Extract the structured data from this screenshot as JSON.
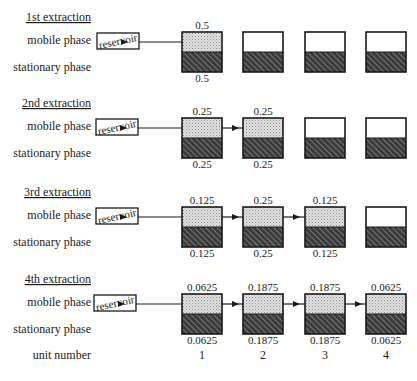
{
  "labels": {
    "mobile_phase": "mobile phase",
    "stationary_phase": "stationary phase",
    "unit_number": "unit number",
    "reservoir": "reservoir"
  },
  "colors": {
    "stroke": "#1a1a1a",
    "mobile_filled": "#d9d9d9",
    "mobile_empty": "#ffffff",
    "stationary_bg": "#3a3a3a",
    "hatch_line": "#9a9a9a"
  },
  "unit_numbers": [
    "1",
    "2",
    "3",
    "4"
  ],
  "extractions": [
    {
      "title": "1st extraction",
      "units": [
        {
          "mobile": "0.5",
          "stationary": "0.5",
          "filled": true
        },
        {
          "mobile": "",
          "stationary": "",
          "filled": false
        },
        {
          "mobile": "",
          "stationary": "",
          "filled": false
        },
        {
          "mobile": "",
          "stationary": "",
          "filled": false
        }
      ]
    },
    {
      "title": "2nd extraction",
      "units": [
        {
          "mobile": "0.25",
          "stationary": "0.25",
          "filled": true
        },
        {
          "mobile": "0.25",
          "stationary": "0.25",
          "filled": true
        },
        {
          "mobile": "",
          "stationary": "",
          "filled": false
        },
        {
          "mobile": "",
          "stationary": "",
          "filled": false
        }
      ]
    },
    {
      "title": "3rd extraction",
      "units": [
        {
          "mobile": "0.125",
          "stationary": "0.125",
          "filled": true
        },
        {
          "mobile": "0.25",
          "stationary": "0.25",
          "filled": true
        },
        {
          "mobile": "0.125",
          "stationary": "0.125",
          "filled": true
        },
        {
          "mobile": "",
          "stationary": "",
          "filled": false
        }
      ]
    },
    {
      "title": "4th extraction",
      "units": [
        {
          "mobile": "0.0625",
          "stationary": "0.0625",
          "filled": true
        },
        {
          "mobile": "0.1875",
          "stationary": "0.1875",
          "filled": true
        },
        {
          "mobile": "0.1875",
          "stationary": "0.1875",
          "filled": true
        },
        {
          "mobile": "0.0625",
          "stationary": "0.0625",
          "filled": true
        }
      ]
    }
  ]
}
